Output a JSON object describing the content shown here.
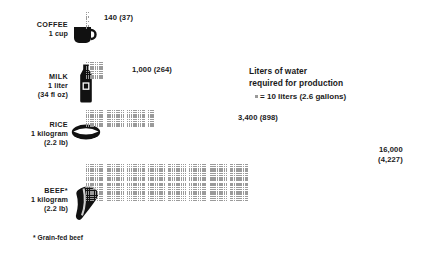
{
  "legend": {
    "title_line1": "Liters of water",
    "title_line2": "required for production",
    "key_text": "= 10 liters (2.6 gallons)",
    "unit_liters": 10,
    "unit_gallons": 2.6
  },
  "footnote": "* Grain-fed beef",
  "rows": [
    {
      "name": "COFFEE",
      "qty_line1": "1 cup",
      "qty_line2": "",
      "icon": "coffee-mug-icon",
      "liters": 140,
      "gallons": 37,
      "callout": "140 (37)"
    },
    {
      "name": "MILK",
      "qty_line1": "1 liter",
      "qty_line2": "(34 fl oz)",
      "icon": "milk-bottle-icon",
      "liters": 1000,
      "gallons": 264,
      "callout": "1,000 (264)"
    },
    {
      "name": "RICE",
      "qty_line1": "1 kilogram",
      "qty_line2": "(2.2 lb)",
      "icon": "rice-bowl-icon",
      "liters": 3400,
      "gallons": 898,
      "callout": "3,400 (898)"
    },
    {
      "name": "BEEF*",
      "qty_line1": "1 kilogram",
      "qty_line2": "(2.2 lb)",
      "icon": "beef-cut-icon",
      "liters": 16000,
      "gallons": 4227,
      "callout_line1": "16,000",
      "callout_line2": "(4,227)"
    }
  ],
  "colors": {
    "dot": "#9a9a9a",
    "text": "#1a1a1a",
    "icon": "#111111",
    "background": "#ffffff"
  },
  "chart_data": {
    "type": "bar",
    "title": "Liters of water required for production",
    "subtitle": "= 10 liters (2.6 gallons) per dot",
    "categories": [
      "COFFEE 1 cup",
      "MILK 1 liter (34 fl oz)",
      "RICE 1 kilogram (2.2 lb)",
      "BEEF* 1 kilogram (2.2 lb)"
    ],
    "values": [
      140,
      1000,
      3400,
      16000
    ],
    "values_gallons": [
      37,
      264,
      898,
      4227
    ],
    "dots": [
      14,
      100,
      340,
      1600
    ],
    "unit": "liters",
    "dot_value": 10,
    "xlabel": "",
    "ylabel": "",
    "ylim": [
      0,
      16000
    ],
    "grid": false,
    "legend_position": "top-right",
    "annotations": [
      "* Grain-fed beef"
    ]
  }
}
